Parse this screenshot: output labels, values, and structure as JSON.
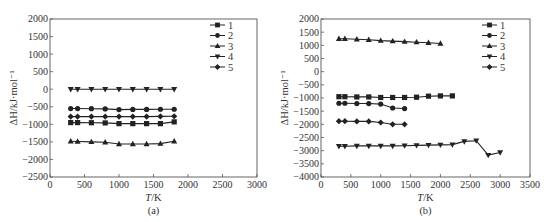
{
  "chart_data": [
    {
      "type": "line",
      "panel_label": "(a)",
      "xlabel": "T/K",
      "ylabel": "ΔH/kJ·mol⁻¹",
      "xlim": [
        0,
        3000
      ],
      "ylim": [
        -2500,
        2000
      ],
      "xticks": [
        0,
        500,
        1000,
        1500,
        2000,
        2500,
        3000
      ],
      "yticks": [
        2000,
        1500,
        1000,
        500,
        0,
        -500,
        -1000,
        -1500,
        -2000,
        -2500
      ],
      "grid": false,
      "legend_position": "upper right",
      "series": [
        {
          "name": "1",
          "marker": "square",
          "x": [
            300,
            400,
            600,
            800,
            1000,
            1200,
            1400,
            1600,
            1800
          ],
          "values": [
            -950,
            -950,
            -955,
            -960,
            -980,
            -980,
            -980,
            -980,
            -930
          ]
        },
        {
          "name": "2",
          "marker": "circle",
          "x": [
            300,
            400,
            600,
            800,
            1000,
            1200,
            1400,
            1600,
            1800
          ],
          "values": [
            -550,
            -550,
            -555,
            -560,
            -580,
            -575,
            -575,
            -570,
            -570
          ]
        },
        {
          "name": "3",
          "marker": "triangle-up",
          "x": [
            300,
            400,
            600,
            800,
            1000,
            1200,
            1400,
            1600,
            1800
          ],
          "values": [
            -1480,
            -1490,
            -1500,
            -1510,
            -1560,
            -1560,
            -1560,
            -1550,
            -1480
          ]
        },
        {
          "name": "4",
          "marker": "triangle-down",
          "x": [
            300,
            400,
            600,
            800,
            1000,
            1200,
            1400,
            1600,
            1800
          ],
          "values": [
            0,
            0,
            0,
            0,
            0,
            0,
            0,
            0,
            0
          ]
        },
        {
          "name": "5",
          "marker": "diamond",
          "x": [
            300,
            400,
            600,
            800,
            1000,
            1200,
            1400,
            1600,
            1800
          ],
          "values": [
            -780,
            -780,
            -780,
            -780,
            -780,
            -780,
            -780,
            -775,
            -770
          ]
        }
      ]
    },
    {
      "type": "line",
      "panel_label": "(b)",
      "xlabel": "T/K",
      "ylabel": "ΔH/kJ·mol⁻¹",
      "xlim": [
        0,
        3500
      ],
      "ylim": [
        -4000,
        2000
      ],
      "xticks": [
        0,
        500,
        1000,
        1500,
        2000,
        2500,
        3000,
        3500
      ],
      "yticks": [
        2000,
        1500,
        1000,
        500,
        0,
        -500,
        -1000,
        -1500,
        -2000,
        -2500,
        -3000,
        -3500,
        -4000
      ],
      "grid": false,
      "legend_position": "upper right",
      "series": [
        {
          "name": "1",
          "marker": "square",
          "x": [
            300,
            400,
            600,
            800,
            1000,
            1200,
            1400,
            1600,
            1800,
            2000,
            2200
          ],
          "values": [
            -950,
            -950,
            -960,
            -960,
            -980,
            -980,
            -980,
            -970,
            -930,
            -920,
            -920
          ]
        },
        {
          "name": "2",
          "marker": "circle",
          "x": [
            300,
            400,
            600,
            800,
            1000,
            1200,
            1400
          ],
          "values": [
            -1200,
            -1200,
            -1210,
            -1210,
            -1230,
            -1380,
            -1400
          ]
        },
        {
          "name": "3",
          "marker": "triangle-up",
          "x": [
            300,
            400,
            600,
            800,
            1000,
            1200,
            1400,
            1600,
            1800,
            2000
          ],
          "values": [
            1250,
            1250,
            1230,
            1210,
            1180,
            1160,
            1140,
            1120,
            1100,
            1070
          ]
        },
        {
          "name": "4",
          "marker": "triangle-down",
          "x": [
            300,
            400,
            600,
            800,
            1000,
            1200,
            1400,
            1600,
            1800,
            2000,
            2200,
            2400,
            2600,
            2800,
            3000
          ],
          "values": [
            -2830,
            -2830,
            -2820,
            -2820,
            -2820,
            -2820,
            -2810,
            -2800,
            -2790,
            -2780,
            -2770,
            -2650,
            -2620,
            -3170,
            -3070
          ]
        },
        {
          "name": "5",
          "marker": "diamond",
          "x": [
            300,
            400,
            600,
            800,
            1000,
            1200,
            1400
          ],
          "values": [
            -1880,
            -1880,
            -1890,
            -1890,
            -1930,
            -2000,
            -2000
          ]
        }
      ]
    }
  ],
  "panels": [
    {
      "label": "(a)",
      "xlabel_italic": "T",
      "xlabel_unit": "/K",
      "ylabel": "ΔH/kJ·mol⁻¹",
      "legend": [
        "1",
        "2",
        "3",
        "4",
        "5"
      ]
    },
    {
      "label": "(b)",
      "xlabel_italic": "T",
      "xlabel_unit": "/K",
      "ylabel": "ΔH/kJ·mol⁻¹",
      "legend": [
        "1",
        "2",
        "3",
        "4",
        "5"
      ]
    }
  ]
}
